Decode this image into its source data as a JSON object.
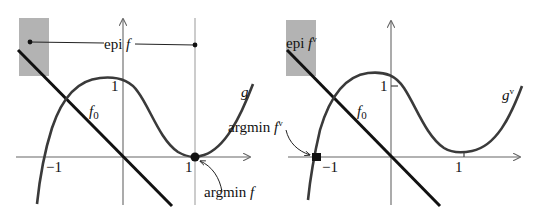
{
  "figure": {
    "left_panel": {
      "labels": {
        "epi": "epi",
        "epi_f": "f",
        "g": "g",
        "f0": "f",
        "f0_sub": "0",
        "argmin": "argmin",
        "argmin_f": "f",
        "tick_y1": "1",
        "tick_x1": "1",
        "tick_xm1": "−1"
      }
    },
    "right_panel": {
      "labels": {
        "epi": "epi",
        "epi_f": "f",
        "epi_sup": "v",
        "g": "g",
        "g_sup": "v",
        "f0": "f",
        "f0_sub": "0",
        "argmin": "argmin",
        "argmin_f": "f",
        "argmin_sup": "v",
        "tick_y1": "1",
        "tick_x1": "1",
        "tick_xm1": "−1"
      }
    },
    "colors": {
      "curve": "#3a3a3a",
      "line": "#111111",
      "axis": "#666666",
      "shade": "#b3b3b3",
      "vline": "#aaaaaa"
    }
  }
}
